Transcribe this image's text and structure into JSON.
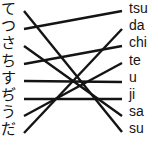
{
  "exercise": {
    "type": "matching-lines",
    "left_column": {
      "label": "hiragana-column",
      "items": [
        {
          "text": "て",
          "y": 10
        },
        {
          "text": "つ",
          "y": 27
        },
        {
          "text": "さ",
          "y": 45
        },
        {
          "text": "ち",
          "y": 62
        },
        {
          "text": "す",
          "y": 81
        },
        {
          "text": "ぢ",
          "y": 98
        },
        {
          "text": "う",
          "y": 115
        },
        {
          "text": "だ",
          "y": 131
        }
      ]
    },
    "right_column": {
      "label": "romaji-column",
      "items": [
        {
          "text": "tsu",
          "y": 10
        },
        {
          "text": "da",
          "y": 28
        },
        {
          "text": "chi",
          "y": 45
        },
        {
          "text": "te",
          "y": 62
        },
        {
          "text": "u",
          "y": 81
        },
        {
          "text": "ji",
          "y": 98
        },
        {
          "text": "sa",
          "y": 115
        },
        {
          "text": "su",
          "y": 131
        }
      ]
    },
    "connections": [
      {
        "from": 0,
        "to": 7,
        "x1": 24,
        "y1": 11,
        "x2": 122,
        "y2": 132
      },
      {
        "from": 1,
        "to": 0,
        "x1": 24,
        "y1": 29,
        "x2": 122,
        "y2": 11
      },
      {
        "from": 2,
        "to": 6,
        "x1": 24,
        "y1": 46,
        "x2": 122,
        "y2": 116
      },
      {
        "from": 3,
        "to": 2,
        "x1": 24,
        "y1": 64,
        "x2": 122,
        "y2": 46
      },
      {
        "from": 4,
        "to": 4,
        "x1": 24,
        "y1": 81,
        "x2": 122,
        "y2": 82
      },
      {
        "from": 5,
        "to": 5,
        "x1": 24,
        "y1": 99,
        "x2": 122,
        "y2": 99
      },
      {
        "from": 6,
        "to": 3,
        "x1": 24,
        "y1": 116,
        "x2": 122,
        "y2": 63
      },
      {
        "from": 7,
        "to": 1,
        "x1": 24,
        "y1": 133,
        "x2": 122,
        "y2": 29
      }
    ],
    "stroke_color": "#141414",
    "text_color": "#141414",
    "background_color": "#ffffff"
  }
}
